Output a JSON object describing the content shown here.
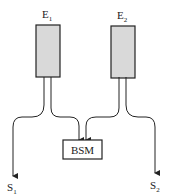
{
  "diagram": {
    "emitters": [
      {
        "id": "E1",
        "label": "E",
        "sub": "1"
      },
      {
        "id": "E2",
        "label": "E",
        "sub": "2"
      }
    ],
    "module": {
      "label": "BSM"
    },
    "outputs": [
      {
        "id": "S1",
        "label": "S",
        "sub": "1"
      },
      {
        "id": "S2",
        "label": "S",
        "sub": "2"
      }
    ],
    "colors": {
      "box_fill": "#d9d9d9",
      "stroke": "#222222"
    }
  }
}
